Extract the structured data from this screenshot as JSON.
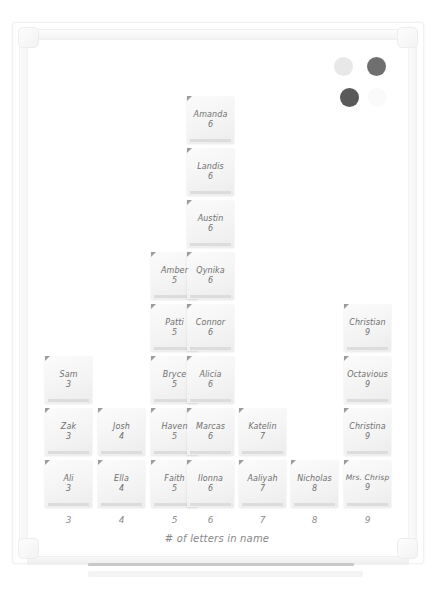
{
  "board": {
    "caption": "# of letters in name",
    "axis_ticks": [
      "3",
      "4",
      "5",
      "6",
      "7",
      "8",
      "9"
    ],
    "magnets": [
      {
        "name": "magnet-light-gray",
        "color": "#e8e8e8",
        "x": 334,
        "y": 57
      },
      {
        "name": "magnet-dark-gray-1",
        "color": "#6f6f6f",
        "x": 367,
        "y": 57
      },
      {
        "name": "magnet-dark-gray-2",
        "color": "#595959",
        "x": 340,
        "y": 88
      },
      {
        "name": "magnet-faint",
        "color": "#fafafa",
        "x": 368,
        "y": 88
      }
    ],
    "tray_label": "marker-tray"
  },
  "chart_data": {
    "type": "bar",
    "title": "",
    "xlabel": "# of letters in name",
    "ylabel": "",
    "categories": [
      "3",
      "4",
      "5",
      "6",
      "7",
      "8",
      "9"
    ],
    "values": [
      3,
      2,
      5,
      8,
      2,
      1,
      4
    ],
    "grid": false,
    "legend": "none",
    "note_label_format": "name + letter count",
    "columns": [
      {
        "letters": "3",
        "count": 3,
        "notes": [
          {
            "name": "Sam",
            "value": "3"
          },
          {
            "name": "Zak",
            "value": "3"
          },
          {
            "name": "Ali",
            "value": "3"
          }
        ]
      },
      {
        "letters": "4",
        "count": 2,
        "notes": [
          {
            "name": "Josh",
            "value": "4"
          },
          {
            "name": "Ella",
            "value": "4"
          }
        ]
      },
      {
        "letters": "5",
        "count": 5,
        "notes": [
          {
            "name": "Amber",
            "value": "5"
          },
          {
            "name": "Patti",
            "value": "5"
          },
          {
            "name": "Bryce",
            "value": "5"
          },
          {
            "name": "Haven",
            "value": "5"
          },
          {
            "name": "Faith",
            "value": "5"
          }
        ]
      },
      {
        "letters": "6",
        "count": 8,
        "notes": [
          {
            "name": "Amanda",
            "value": "6"
          },
          {
            "name": "Landis",
            "value": "6"
          },
          {
            "name": "Austin",
            "value": "6"
          },
          {
            "name": "Qynika",
            "value": "6"
          },
          {
            "name": "Connor",
            "value": "6"
          },
          {
            "name": "Alicia",
            "value": "6"
          },
          {
            "name": "Marcas",
            "value": "6"
          },
          {
            "name": "Ilonna",
            "value": "6"
          }
        ]
      },
      {
        "letters": "7",
        "count": 2,
        "notes": [
          {
            "name": "Katelin",
            "value": "7"
          },
          {
            "name": "Aaliyah",
            "value": "7"
          }
        ]
      },
      {
        "letters": "8",
        "count": 1,
        "notes": [
          {
            "name": "Nicholas",
            "value": "8"
          }
        ]
      },
      {
        "letters": "9",
        "count": 4,
        "notes": [
          {
            "name": "Christian",
            "value": "9"
          },
          {
            "name": "Octavious",
            "value": "9"
          },
          {
            "name": "Christina",
            "value": "9"
          },
          {
            "name": "Mrs. Chrisp",
            "value": "9"
          }
        ]
      }
    ]
  },
  "layout": {
    "col_x": [
      45,
      98,
      151,
      187,
      239,
      291,
      344
    ],
    "row_y": [
      96,
      148,
      200,
      252,
      304,
      356,
      408,
      460
    ],
    "note_w": 47,
    "note_h": 47,
    "axis_y": 515,
    "col_note_rows": {
      "3": [
        5,
        6,
        7
      ],
      "4": [
        6,
        7
      ],
      "5": [
        3,
        4,
        5,
        6,
        7
      ],
      "6": [
        0,
        1,
        2,
        3,
        4,
        5,
        6,
        7
      ],
      "7": [
        6,
        7
      ],
      "8": [
        7
      ],
      "9": [
        4,
        5,
        6,
        7
      ]
    }
  }
}
